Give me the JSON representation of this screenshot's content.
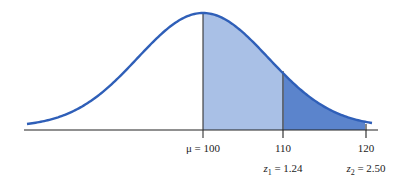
{
  "chart_data": {
    "type": "area",
    "title": "",
    "distribution": {
      "mean": 100,
      "sd": 8.06
    },
    "x_ticks": [
      {
        "value": 100,
        "label": "μ = 100",
        "z_label": ""
      },
      {
        "value": 110,
        "label": "110",
        "z_label": "z1 = 1.24"
      },
      {
        "value": 120,
        "label": "120",
        "z_label": "z2 = 2.50"
      }
    ],
    "shaded_regions": [
      {
        "from": 100,
        "to": 110,
        "color": "#a9c0e6",
        "shade": "light"
      },
      {
        "from": 110,
        "to": 120,
        "color": "#5b84cc",
        "shade": "dark"
      }
    ],
    "curve_color": "#2f5fb8",
    "axis_color": "#222222",
    "xlabel": "",
    "ylabel": "",
    "grid": false,
    "legend": null
  },
  "labels": {
    "mu": "μ = 100",
    "x110": "110",
    "x120": "120",
    "z1_sym": "z",
    "z1_sub": "1",
    "z1_val": " = 1.24",
    "z2_sym": "z",
    "z2_sub": "2",
    "z2_val": " = 2.50"
  }
}
